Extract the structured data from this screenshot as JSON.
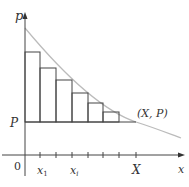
{
  "diagram": {
    "axes": {
      "y_label": "p",
      "x_label": "x",
      "origin_label": "0"
    },
    "labels": {
      "P": "P",
      "point": "(X, P)",
      "x1": "x",
      "x1_sub": "1",
      "xi": "x",
      "xi_sub": "i",
      "X": "X"
    },
    "bars": [
      {
        "x0": 25,
        "x1": 40,
        "top": 52
      },
      {
        "x0": 40,
        "x1": 56,
        "top": 68
      },
      {
        "x0": 56,
        "x1": 72,
        "top": 80
      },
      {
        "x0": 72,
        "x1": 88,
        "top": 93
      },
      {
        "x0": 88,
        "x1": 103,
        "top": 103
      },
      {
        "x0": 103,
        "x1": 119,
        "top": 112
      }
    ],
    "colors": {
      "line": "#444444",
      "curve": "#bbbbbb"
    }
  }
}
